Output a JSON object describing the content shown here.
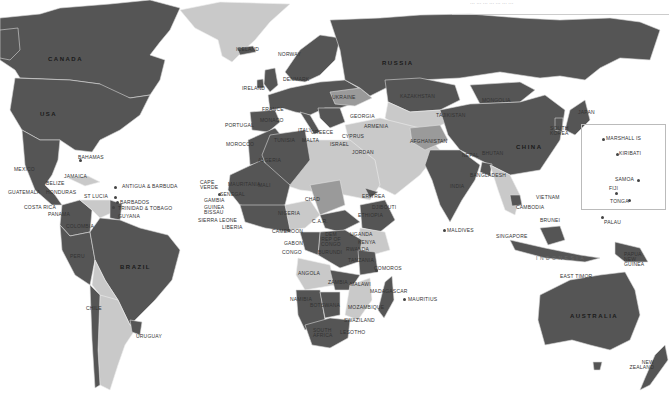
{
  "map": {
    "title_fragment": "··· ··· ··· ··· ··· ··· ···",
    "legend_shades": {
      "dark": "#555555",
      "mid": "#9a9a9a",
      "light": "#c9c9c9",
      "water": "#ffffff"
    },
    "labels": {
      "canada": "CANADA",
      "usa": "USA",
      "mexico": "MEXICO",
      "bahamas": "BAHAMAS",
      "jamaica": "JAMAICA",
      "belize": "BELIZE",
      "guatemala": "GUATEMALA",
      "honduras": "HONDURAS",
      "antigua": "ANTIGUA & BARBUDA",
      "st_lucia": "ST LUCIA",
      "barbados": "BARBADOS",
      "trinidad": "TRINIDAD & TOBAGO",
      "guyana": "GUYANA",
      "costa_rica": "COSTA RICA",
      "panama": "PANAMA",
      "colombia": "COLOMBIA",
      "peru": "PERU",
      "brazil": "BRAZIL",
      "chile": "CHILE",
      "uruguay": "URUGUAY",
      "iceland": "ICELAND",
      "norway": "NORWAY",
      "ireland": "IRELAND",
      "denmark": "DENMARK",
      "france": "FRANCE",
      "portugal": "PORTUGAL",
      "spain": "SPAIN",
      "monaco": "MONACO",
      "italy": "ITALY",
      "greece": "GREECE",
      "malta": "MALTA",
      "ukraine": "UKRAINE",
      "georgia": "GEORGIA",
      "armenia": "ARMENIA",
      "cyprus": "CYPRUS",
      "israel": "ISRAEL",
      "jordan": "JORDAN",
      "tunisia": "TUNISIA",
      "morocco": "MOROCCO",
      "algeria": "ALGERIA",
      "cape_verde": "CAPE VERDE",
      "senegal": "SENEGAL",
      "gambia": "GAMBIA",
      "guinea_bissau": "GUINEA BISSAU",
      "sierra_leone": "SIERRA LEONE",
      "liberia": "LIBERIA",
      "mauritania": "MAURITANIA",
      "mali": "MALI",
      "nigeria": "NIGERIA",
      "chad": "CHAD",
      "cameroon": "CAMEROON",
      "car": "C.A.R.",
      "gabon": "GABON",
      "congo": "CONGO",
      "drc": "DEM REP OF CONGO",
      "burundi": "BURUNDI",
      "uganda": "UGANDA",
      "kenya": "KENYA",
      "rwanda": "RWANDA",
      "tanzania": "TANZANIA",
      "eritrea": "ERITREA",
      "djibouti": "DJIBOUTI",
      "ethiopia": "ETHIOPIA",
      "angola": "ANGOLA",
      "zambia": "ZAMBIA",
      "malawi": "MALAWI",
      "namibia": "NAMIBIA",
      "botswana": "BOTSWANA",
      "mozambique": "MOZAMBIQUE",
      "south_africa": "SOUTH AFRICA",
      "swaziland": "SWAZILAND",
      "lesotho": "LESOTHO",
      "madagascar": "MADAGASCAR",
      "comoros": "COMOROS",
      "mauritius": "MAURITIUS",
      "russia": "RUSSIA",
      "kazakhstan": "KAZAKHSTAN",
      "mongolia": "MONGOLIA",
      "tajikistan": "TAJIKISTAN",
      "afghanistan": "AFGHANISTAN",
      "china": "CHINA",
      "india": "INDIA",
      "nepal": "NEPAL",
      "bhutan": "BHUTAN",
      "bangladesh": "BANGLADESH",
      "maldives": "MALDIVES",
      "south_korea": "SOUTH KOREA",
      "japan": "JAPAN",
      "vietnam": "VIETNAM",
      "cambodia": "CAMBODIA",
      "brunei": "BRUNEI",
      "singapore": "SINGAPORE",
      "indonesia": "INDONESIA",
      "east_timor": "EAST TIMOR",
      "papua": "PAPUA NEW GUINEA",
      "palau": "PALAU",
      "australia": "AUSTRALIA",
      "new_zealand": "NEW ZEALAND",
      "marshall": "MARSHALL IS",
      "kiribati": "KIRIBATI",
      "samoa": "SAMOA",
      "fiji": "FIJI",
      "tonga": "TONGA"
    }
  }
}
